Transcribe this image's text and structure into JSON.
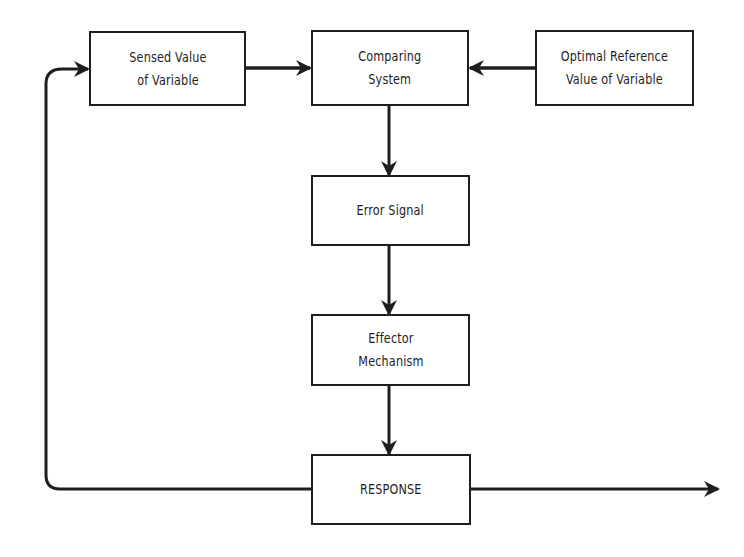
{
  "diagram": {
    "type": "feedback-control-flowchart",
    "nodes": {
      "sensed": {
        "label": "Sensed Value\nof Variable"
      },
      "comparing": {
        "label": "Comparing\nSystem"
      },
      "optimal": {
        "label": "Optimal Reference\nValue of Variable"
      },
      "error": {
        "label": "Error  Signal"
      },
      "effector": {
        "label": "Effector\nMechanism"
      },
      "response": {
        "label": "RESPONSE"
      }
    },
    "edges": [
      {
        "from": "sensed",
        "to": "comparing"
      },
      {
        "from": "optimal",
        "to": "comparing"
      },
      {
        "from": "comparing",
        "to": "error"
      },
      {
        "from": "error",
        "to": "effector"
      },
      {
        "from": "effector",
        "to": "response"
      },
      {
        "from": "response",
        "to": "sensed",
        "type": "feedback-loop"
      },
      {
        "from": "response",
        "to": "output",
        "type": "output-arrow"
      }
    ],
    "colors": {
      "line": "#1e1e1e",
      "background": "#ffffff"
    }
  }
}
